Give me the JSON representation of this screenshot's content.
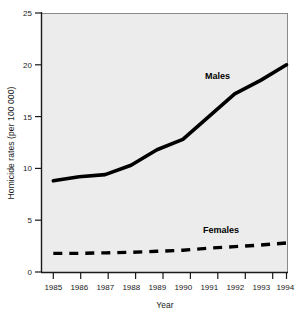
{
  "chart_data": {
    "type": "line",
    "title": "",
    "subtitle": "",
    "xlabel": "Year",
    "ylabel": "Homicide rates (per 100 000)",
    "categories": [
      "1985",
      "1986",
      "1987",
      "1988",
      "1989",
      "1990",
      "1991",
      "1992",
      "1993",
      "1994"
    ],
    "x": [
      1985,
      1986,
      1987,
      1988,
      1989,
      1990,
      1991,
      1992,
      1993,
      1994
    ],
    "xlim": [
      1985,
      1994
    ],
    "ylim": [
      0,
      25
    ],
    "yticks": [
      0,
      5,
      10,
      15,
      20,
      25
    ],
    "ytick_labels": [
      "0",
      "5",
      "10",
      "15",
      "20",
      "25"
    ],
    "grid": false,
    "legend_position": "inline-annotation",
    "series": [
      {
        "name": "Males",
        "style": "solid",
        "color": "#000000",
        "values": [
          8.8,
          9.2,
          9.4,
          10.3,
          11.8,
          12.8,
          15.0,
          17.2,
          18.5,
          20.0
        ]
      },
      {
        "name": "Females",
        "style": "dashed",
        "color": "#000000",
        "values": [
          1.8,
          1.8,
          1.85,
          1.9,
          2.0,
          2.1,
          2.3,
          2.45,
          2.6,
          2.8
        ]
      }
    ],
    "annotations": [
      {
        "text": "Males",
        "x": 1991.3,
        "y": 20.2
      },
      {
        "text": "Females",
        "x": 1991.2,
        "y": 5.0
      }
    ],
    "plot_background": "#ececec",
    "plot_border_color": "#6f6f6f",
    "axis_color": "#1a1a1a"
  }
}
